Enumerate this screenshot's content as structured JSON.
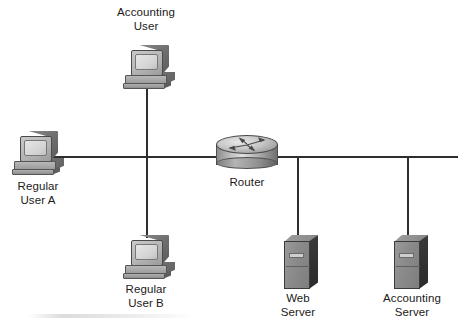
{
  "diagram": {
    "background_color": "#ffffff",
    "line_color": "#2e2e2e",
    "nodes": [
      {
        "id": "accounting-user",
        "type": "workstation",
        "label": "Accounting\nUser",
        "label_lines": [
          "Accounting",
          "User"
        ],
        "x": 123,
        "y": 45
      },
      {
        "id": "regular-user-a",
        "type": "workstation",
        "label": "Regular\nUser A",
        "label_lines": [
          "Regular",
          "User A"
        ],
        "x": 12,
        "y": 131
      },
      {
        "id": "regular-user-b",
        "type": "workstation",
        "label": "Regular\nUser B",
        "label_lines": [
          "Regular",
          "User B"
        ],
        "x": 123,
        "y": 235
      },
      {
        "id": "router",
        "type": "router",
        "label": "Router",
        "label_lines": [
          "Router"
        ],
        "x": 216,
        "y": 135
      },
      {
        "id": "web-server",
        "type": "server",
        "label": "Web\nServer",
        "label_lines": [
          "Web",
          "Server"
        ],
        "x": 284,
        "y": 235
      },
      {
        "id": "accounting-server",
        "type": "server",
        "label": "Accounting\nServer",
        "label_lines": [
          "Accounting",
          "Server"
        ],
        "x": 394,
        "y": 235
      }
    ],
    "links": [
      {
        "id": "backbone-left",
        "from": "regular-user-a",
        "to": "router",
        "orientation": "horizontal"
      },
      {
        "id": "backbone-right",
        "from": "router",
        "to": "accounting-server",
        "orientation": "horizontal"
      },
      {
        "id": "drop-accounting-user",
        "from": "accounting-user",
        "to": "backbone-left",
        "orientation": "vertical"
      },
      {
        "id": "drop-regular-user-b",
        "from": "regular-user-b",
        "to": "backbone-left",
        "orientation": "vertical"
      },
      {
        "id": "drop-web-server",
        "from": "web-server",
        "to": "backbone-right",
        "orientation": "vertical"
      },
      {
        "id": "drop-accounting-server",
        "from": "accounting-server",
        "to": "backbone-right",
        "orientation": "vertical"
      }
    ]
  }
}
